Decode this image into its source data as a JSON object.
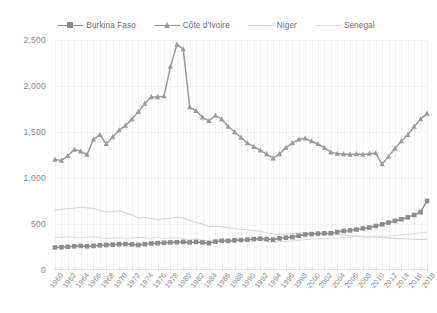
{
  "legend": {
    "position": "top-center",
    "items": [
      {
        "label": "Burkina Faso",
        "marker": "square-marker-icon",
        "color": "#8c8c8c"
      },
      {
        "label": "Côte d'Ivoire",
        "marker": "triangle-marker-icon",
        "color": "#9a9a9a"
      },
      {
        "label": "Niger",
        "marker": "line-marker-icon",
        "color": "#d2d2d2"
      },
      {
        "label": "Senegal",
        "marker": "line-marker-icon",
        "color": "#dcdcdc"
      }
    ]
  },
  "axes": {
    "y_ticks": [
      "0",
      "500",
      "1,000",
      "1,500",
      "2,000",
      "2,500"
    ],
    "y_min": 0,
    "y_max": 2500,
    "x_ticks": [
      "1960",
      "1962",
      "1964",
      "1966",
      "1968",
      "1970",
      "1972",
      "1974",
      "1976",
      "1978",
      "1980",
      "1982",
      "1984",
      "1986",
      "1988",
      "1990",
      "1992",
      "1994",
      "1996",
      "1998",
      "2000",
      "2002",
      "2004",
      "2006",
      "2008",
      "2010",
      "2012",
      "2014",
      "2016",
      "2018"
    ],
    "x_min": 1960,
    "x_max": 2018
  },
  "chart_data": {
    "type": "line",
    "title": "",
    "subtitle": "",
    "xlabel": "",
    "ylabel": "",
    "ylim": [
      0,
      2500
    ],
    "xlim": [
      1960,
      2018
    ],
    "grid": true,
    "legend_position": "top-center",
    "x": [
      1960,
      1961,
      1962,
      1963,
      1964,
      1965,
      1966,
      1967,
      1968,
      1969,
      1970,
      1971,
      1972,
      1973,
      1974,
      1975,
      1976,
      1977,
      1978,
      1979,
      1980,
      1981,
      1982,
      1983,
      1984,
      1985,
      1986,
      1987,
      1988,
      1989,
      1990,
      1991,
      1992,
      1993,
      1994,
      1995,
      1996,
      1997,
      1998,
      1999,
      2000,
      2001,
      2002,
      2003,
      2004,
      2005,
      2006,
      2007,
      2008,
      2009,
      2010,
      2011,
      2012,
      2013,
      2014,
      2015,
      2016,
      2017,
      2018
    ],
    "series": [
      {
        "name": "Burkina Faso",
        "color": "#8c8c8c",
        "marker": "square",
        "values": [
          245,
          248,
          252,
          258,
          262,
          258,
          262,
          268,
          272,
          276,
          280,
          282,
          278,
          272,
          280,
          288,
          292,
          296,
          300,
          302,
          305,
          300,
          305,
          300,
          292,
          308,
          318,
          316,
          322,
          326,
          330,
          336,
          340,
          336,
          330,
          344,
          352,
          358,
          372,
          386,
          390,
          396,
          398,
          400,
          412,
          424,
          430,
          440,
          452,
          462,
          478,
          496,
          516,
          534,
          552,
          572,
          598,
          628,
          750
        ]
      },
      {
        "name": "Côte d'Ivoire",
        "color": "#9a9a9a",
        "marker": "triangle",
        "values": [
          1200,
          1190,
          1240,
          1310,
          1290,
          1255,
          1420,
          1470,
          1370,
          1445,
          1520,
          1570,
          1640,
          1720,
          1810,
          1880,
          1880,
          1890,
          2210,
          2450,
          2400,
          1770,
          1730,
          1660,
          1620,
          1680,
          1640,
          1560,
          1500,
          1440,
          1380,
          1340,
          1300,
          1260,
          1215,
          1260,
          1330,
          1380,
          1420,
          1430,
          1400,
          1370,
          1330,
          1280,
          1265,
          1260,
          1255,
          1260,
          1255,
          1265,
          1270,
          1150,
          1235,
          1320,
          1400,
          1470,
          1560,
          1640,
          1700
        ]
      },
      {
        "name": "Niger",
        "color": "#d2d2d2",
        "marker": "none",
        "values": [
          650,
          660,
          668,
          672,
          680,
          676,
          668,
          648,
          628,
          636,
          642,
          620,
          600,
          565,
          572,
          560,
          548,
          556,
          562,
          572,
          566,
          540,
          520,
          498,
          470,
          476,
          470,
          460,
          452,
          442,
          436,
          428,
          420,
          404,
          390,
          388,
          392,
          396,
          400,
          404,
          396,
          398,
          392,
          388,
          382,
          378,
          372,
          368,
          362,
          356,
          358,
          352,
          348,
          344,
          340,
          336,
          334,
          332,
          330
        ]
      },
      {
        "name": "Senegal",
        "color": "#dcdcdc",
        "marker": "none",
        "values": [
          350,
          356,
          360,
          352,
          348,
          356,
          362,
          352,
          340,
          346,
          352,
          344,
          348,
          356,
          352,
          344,
          356,
          340,
          348,
          352,
          340,
          330,
          338,
          326,
          318,
          322,
          330,
          336,
          330,
          326,
          330,
          324,
          320,
          312,
          300,
          306,
          312,
          316,
          322,
          330,
          336,
          340,
          338,
          344,
          348,
          352,
          358,
          366,
          368,
          362,
          368,
          366,
          368,
          374,
          380,
          388,
          396,
          404,
          410
        ]
      }
    ]
  }
}
